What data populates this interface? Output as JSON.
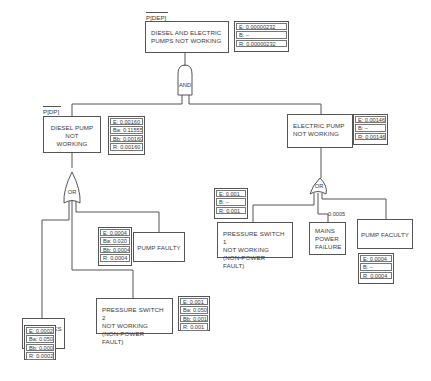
{
  "diagram": {
    "type": "fault-tree",
    "top_event": {
      "tag": "P[DEP]",
      "label": "DIESEL AND ELECTRIC\nPUMPS NOT WORKING",
      "probs": [
        "E: 0.00000232",
        "B:        –",
        "R: 0.00000232"
      ]
    },
    "and_gate": {
      "label": "AND"
    },
    "diesel_pump": {
      "tag": "P[DP]",
      "label": "DIESEL PUMP\nNOT WORKING",
      "probs": [
        "E: 0.00160",
        "Ba: 0.11555",
        "Bb: 0.00160",
        "R: 0.00160"
      ]
    },
    "diesel_or_gate": {
      "label": "OR"
    },
    "diesel_pump_faulty": {
      "label": "PUMP FAULTY",
      "probs": [
        "E: 0.0004",
        "Ba: 0.020",
        "Bb: 0.0004",
        "R: 0.0004"
      ]
    },
    "batteries_flat": {
      "label": "BATTERIES\nFLAT",
      "probs": [
        "E: 0.0002",
        "Ba: 0.050",
        "Bb: 0.0002",
        "R: 0.0002"
      ]
    },
    "pressure_switch_2": {
      "label": "PRESSURE SWITCH 2\nNOT WORKING\n(NON-POWER FAULT)",
      "probs": [
        "E: 0.001",
        "Ba: 0.050",
        "Bb: 0.001",
        "R: 0.001"
      ]
    },
    "electric_pump": {
      "label": "ELECTRIC PUMP\nNOT WORKING",
      "probs": [
        "E: 0.00146",
        "B:      –",
        "R: 0.00146"
      ]
    },
    "electric_or_gate": {
      "label": "OR"
    },
    "pressure_switch_1": {
      "label": "PRESSURE SWITCH 1\nNOT WORKING\n(NON-POWER FAULT)",
      "probs": [
        "E: 0.001",
        "B:      –",
        "R: 0.001"
      ]
    },
    "mains_power_failure": {
      "label": "MAINS\nPOWER\nFAILURE",
      "value": "0.0005"
    },
    "electric_pump_faculty": {
      "label": "PUMP FACULTY",
      "probs": [
        "E: 0.0004",
        "B:      –",
        "R: 0.0004"
      ]
    }
  }
}
